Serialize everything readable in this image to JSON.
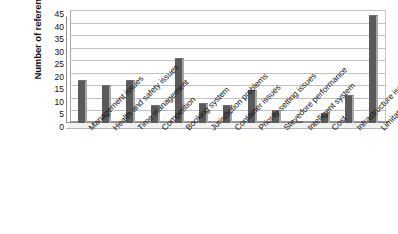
{
  "chart_data": {
    "type": "bar",
    "title": "",
    "xlabel": "",
    "ylabel": "Number of references",
    "ylim": [
      0,
      45
    ],
    "ytick_step": 5,
    "yticks": [
      45,
      40,
      35,
      30,
      25,
      20,
      15,
      10,
      5,
      0
    ],
    "grid": true,
    "legend": false,
    "orientation": "vertical",
    "xtick_rotation": -45,
    "categories": [
      "Management issues",
      "Health and safety issues",
      "Time management",
      "Competition",
      "Booking system",
      "Jurisdiction problems",
      "Container issues",
      "Priority setting issues",
      "Stevedore performance",
      "Intelligent system",
      "Cost",
      "Infrastructure issues",
      "Limitation at port"
    ],
    "values": [
      17,
      15,
      17,
      7,
      26,
      8,
      7,
      13,
      5,
      1,
      4,
      11,
      43
    ],
    "series": [
      {
        "name": "Number of references",
        "values": [
          17,
          15,
          17,
          7,
          26,
          8,
          7,
          13,
          5,
          1,
          4,
          11,
          43
        ]
      }
    ],
    "colors": {
      "bar_fill": "#5a5a5a",
      "bar_edge": "#a6a6a6",
      "gridline": "#c2c2c2",
      "axis": "#8f8f8f",
      "background": "#ffffff",
      "text": "#141414"
    }
  }
}
